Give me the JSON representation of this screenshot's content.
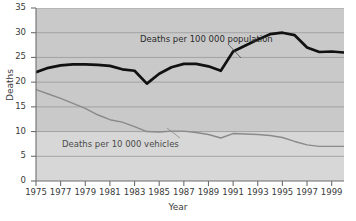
{
  "chart_data": {
    "type": "line",
    "title": "",
    "xlabel": "Year",
    "ylabel": "Deaths",
    "xlim": [
      1975,
      2000
    ],
    "ylim": [
      0,
      35
    ],
    "grid": true,
    "legend": "annotations-inline",
    "x_ticks": [
      "1975",
      "1977",
      "1979",
      "1981",
      "1983",
      "1985",
      "1987",
      "1989",
      "1991",
      "1993",
      "1995",
      "1997",
      "1999"
    ],
    "y_ticks": [
      "0",
      "5",
      "10",
      "15",
      "20",
      "25",
      "30",
      "35"
    ],
    "x": [
      1975,
      1976,
      1977,
      1978,
      1979,
      1980,
      1981,
      1982,
      1983,
      1984,
      1985,
      1986,
      1987,
      1988,
      1989,
      1990,
      1991,
      1992,
      1993,
      1994,
      1995,
      1996,
      1997,
      1998,
      1999,
      2000
    ],
    "series": [
      {
        "name": "Deaths per 100 000 population",
        "color": "#111111",
        "width": 2.6,
        "values": [
          22.0,
          22.9,
          23.4,
          23.6,
          23.6,
          23.5,
          23.3,
          22.6,
          22.3,
          19.7,
          21.7,
          23.0,
          23.7,
          23.7,
          23.2,
          22.3,
          21.3,
          20.0,
          19.7,
          20.9,
          22.0,
          23.1,
          23.8,
          24.0,
          24.6,
          25.4
        ]
      },
      {
        "name": "Deaths per 10 000 vehicles",
        "color": "#8a8a8a",
        "width": 1.3,
        "values": [
          18.5,
          17.6,
          16.7,
          15.7,
          14.7,
          13.4,
          12.4,
          11.9,
          11.0,
          10.0,
          9.9,
          10.1,
          10.1,
          9.8,
          9.4,
          8.7,
          9.4,
          10.1,
          9.9,
          10.0,
          10.0,
          9.9,
          9.8,
          9.8,
          9.7,
          9.6
        ]
      }
    ],
    "series_tail": {
      "note": "series continue to 1999/2000 endpoints",
      "black_tail": [
        26.2,
        27.4,
        28.6,
        29.7,
        30.0,
        29.5,
        27.0,
        26.1,
        26.2,
        26.0
      ],
      "gray_tail": [
        9.6,
        9.5,
        9.4,
        9.2,
        8.8,
        8.0,
        7.3,
        7.0,
        7.0,
        7.0
      ]
    },
    "annotations": [
      {
        "text": "Deaths per 100 000 population",
        "series": "Deaths per 100 000 population"
      },
      {
        "text": "Deaths per 10 000 vehicles",
        "series": "Deaths per 10 000 vehicles"
      }
    ]
  },
  "axes": {
    "ylabel": "Deaths",
    "xlabel": "Year",
    "y_ticks": [
      "35",
      "30",
      "25",
      "20",
      "15",
      "10",
      "5",
      "0"
    ],
    "x_ticks": [
      "1975",
      "1977",
      "1979",
      "1981",
      "1983",
      "1985",
      "1987",
      "1989",
      "1991",
      "1993",
      "1995",
      "1997",
      "1999"
    ]
  },
  "annotations": {
    "black_label": "Deaths per 100 000 population",
    "gray_label": "Deaths per 10 000 vehicles"
  },
  "colors": {
    "plot_background": "#c9c9c9",
    "plot_lower_band": "#d7d7d7",
    "black_series": "#111111",
    "gray_series": "#8a8a8a",
    "gridline": "#9e9e9e",
    "axis": "#6e6e6e",
    "text": "#3a3a3a",
    "page_background": "#ffffff"
  }
}
